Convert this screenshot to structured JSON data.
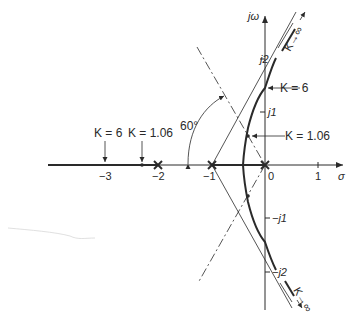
{
  "diagram": {
    "type": "root-locus",
    "axes": {
      "real_label": "σ",
      "imag_label": "jω",
      "real_ticks": [
        {
          "value": -3,
          "label": "−3"
        },
        {
          "value": -2,
          "label": "−2"
        },
        {
          "value": -1,
          "label": "−1"
        },
        {
          "value": 0,
          "label": "0"
        },
        {
          "value": 1,
          "label": "1"
        }
      ],
      "imag_ticks": [
        {
          "value": 2,
          "label": "j2"
        },
        {
          "value": 1,
          "label": "j1"
        },
        {
          "value": -1,
          "label": "−j1"
        },
        {
          "value": -2,
          "label": "−j2"
        }
      ]
    },
    "poles": [
      0,
      -1,
      -2
    ],
    "angle_label": "60°",
    "annotations": {
      "k6_imag": "K = 6",
      "k106_imag": "K = 1.06",
      "k6_real": "K = 6",
      "k106_real": "K = 1.06",
      "k_inf_upper": "K→∞",
      "k_inf_lower": "K→∞"
    },
    "colors": {
      "ink": "#2a2a2a",
      "background": "#ffffff"
    }
  }
}
